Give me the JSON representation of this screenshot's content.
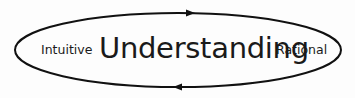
{
  "diagram": {
    "center_label": "Understanding",
    "left_label": "Intuitive",
    "right_label": "Rational",
    "cycle": {
      "shape": "ellipse",
      "top_arrow_direction": "right",
      "bottom_arrow_direction": "left"
    },
    "stroke_color": "#111111"
  }
}
